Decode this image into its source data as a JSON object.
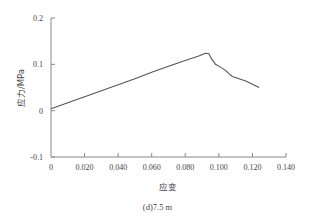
{
  "chart_data": {
    "type": "line",
    "title": "",
    "caption": "(d)7.5 m",
    "xlabel": "应变",
    "ylabel": "应力/MPa",
    "xlim": [
      0,
      0.14
    ],
    "ylim": [
      -0.1,
      0.2
    ],
    "grid": false,
    "legend": null,
    "x_ticks": [
      0,
      0.02,
      0.04,
      0.06,
      0.08,
      0.1,
      0.12,
      0.14
    ],
    "x_tick_labels": [
      "0",
      "0.020",
      "0.040",
      "0.060",
      "0.080",
      "0.100",
      "0.120",
      "0.140"
    ],
    "y_ticks": [
      -0.1,
      0,
      0.1,
      0.2
    ],
    "y_tick_labels": [
      "-0.1",
      "0",
      "0.1",
      "0.2"
    ],
    "series": [
      {
        "name": "应力-应变",
        "color": "#555555",
        "x": [
          0,
          0.01,
          0.02,
          0.03,
          0.04,
          0.05,
          0.06,
          0.07,
          0.08,
          0.088,
          0.092,
          0.094,
          0.096,
          0.098,
          0.101,
          0.104,
          0.106,
          0.108,
          0.112,
          0.116,
          0.12,
          0.124
        ],
        "y": [
          0.004,
          0.017,
          0.03,
          0.043,
          0.056,
          0.069,
          0.083,
          0.096,
          0.108,
          0.118,
          0.124,
          0.123,
          0.11,
          0.1,
          0.094,
          0.087,
          0.08,
          0.074,
          0.069,
          0.064,
          0.057,
          0.05
        ]
      }
    ]
  }
}
